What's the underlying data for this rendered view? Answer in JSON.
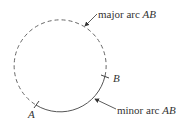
{
  "diagram": {
    "circle": {
      "cx": 60,
      "cy": 66,
      "r": 46
    },
    "points": [
      {
        "name": "A",
        "label": "A"
      },
      {
        "name": "B",
        "label": "B"
      }
    ],
    "labels": {
      "major_prefix": "major arc ",
      "major_var": "AB",
      "minor_prefix": "minor arc ",
      "minor_var": "AB",
      "point_a": "A",
      "point_b": "B"
    },
    "colors": {
      "stroke": "#555555",
      "text": "#333333"
    }
  }
}
